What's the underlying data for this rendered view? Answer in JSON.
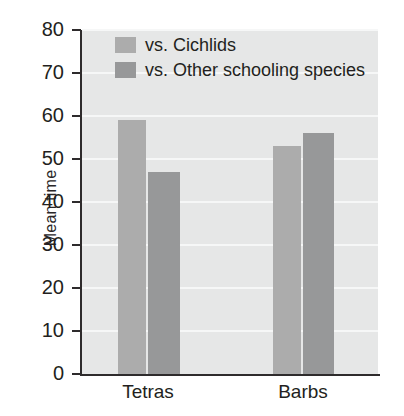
{
  "chart_data": {
    "type": "bar",
    "title": "",
    "xlabel": "",
    "ylabel": "Mean time",
    "categories": [
      "Tetras",
      "Barbs"
    ],
    "series": [
      {
        "name": "vs. Cichlids",
        "color": "#acacac",
        "values": [
          59,
          53
        ]
      },
      {
        "name": "vs. Other schooling species",
        "color": "#979899",
        "values": [
          47,
          56
        ]
      }
    ],
    "ylim": [
      0,
      80
    ],
    "ytick_step": 10,
    "yticks": [
      80,
      70,
      60,
      50,
      40,
      30,
      20,
      10,
      0
    ],
    "ytick_labels": [
      "80",
      "70",
      "60",
      "50",
      "40",
      "30",
      "20",
      "10",
      "0"
    ],
    "grid": "horizontal",
    "legend_position": "top-left",
    "plot_background": "#e6e7e7",
    "gridline_color": "#f6f7f7",
    "axis_color": "#2e2b2c"
  },
  "legend": {
    "items": [
      {
        "label": "vs. Cichlids"
      },
      {
        "label": "vs. Other schooling species"
      }
    ]
  },
  "axes": {
    "y_title": "Mean time"
  }
}
